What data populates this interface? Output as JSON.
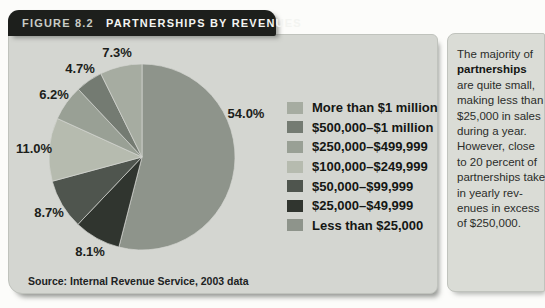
{
  "header": {
    "figure_label": "FIGURE 8.2",
    "title": "PARTNERSHIPS BY REVENUES"
  },
  "chart_data": {
    "type": "pie",
    "title": "FIGURE 8.2 PARTNERSHIPS BY REVENUES",
    "units": "percent of partnerships",
    "start_angle_deg": 0,
    "direction": "clockwise",
    "legend_position": "right",
    "legend_order": "reversed_from_draw_order",
    "label_format": "one_decimal_percent",
    "slices": [
      {
        "label": "Less than $25,000",
        "value": 54.0,
        "color": "#8e948b"
      },
      {
        "label": "$25,000–$49,999",
        "value": 8.1,
        "color": "#30352f"
      },
      {
        "label": "$50,000–$99,999",
        "value": 8.7,
        "color": "#4f554e"
      },
      {
        "label": "$100,000–$249,999",
        "value": 11.0,
        "color": "#b6bbaf"
      },
      {
        "label": "$250,000–$499,999",
        "value": 6.2,
        "color": "#99a095"
      },
      {
        "label": "$500,000–$1 million",
        "value": 4.7,
        "color": "#747b72"
      },
      {
        "label": "More than $1 million",
        "value": 7.3,
        "color": "#a6aca1"
      }
    ],
    "source": "Source: Internal Revenue Service, 2003 data"
  },
  "source_line": "Source: Internal Revenue Service, 2003 data",
  "sidebar": {
    "lines": [
      "The majority of",
      "**partnerships**",
      "are quite small,",
      "making less than",
      "$25,000 in sales",
      "during a year.",
      "However, close",
      "to 20 percent of",
      "partnerships take",
      "in yearly rev-",
      "enues in excess",
      "of $250,000."
    ]
  },
  "colors": {
    "page_bg": "#fcfcfa",
    "tab_bg": "#1d1f1c",
    "panel_bg": "#d4d6d1",
    "sidebar_bg": "#dadcd6",
    "slice_stroke": "#d4d6d1",
    "label_text": "#1c1e1b"
  }
}
